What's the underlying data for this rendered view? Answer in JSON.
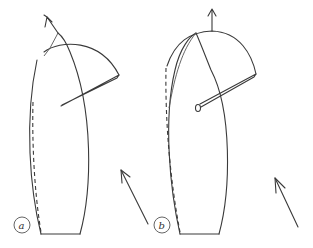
{
  "diagrams": [
    {
      "id": "a",
      "label": "a",
      "parts": [
        "hull-outline",
        "sail-leech",
        "sail-foot-arc",
        "boom",
        "mast-arrow",
        "dashed-centerline"
      ],
      "wind_arrow": "wind-arrow-a"
    },
    {
      "id": "b",
      "label": "b",
      "parts": [
        "hull-outline",
        "sail-leech",
        "sail-foot-arc",
        "boom",
        "mast-arrow",
        "dashed-centerline"
      ],
      "wind_arrow": "wind-arrow-b"
    }
  ],
  "colors": {
    "line": "#3a3a3a",
    "background": "#ffffff"
  }
}
